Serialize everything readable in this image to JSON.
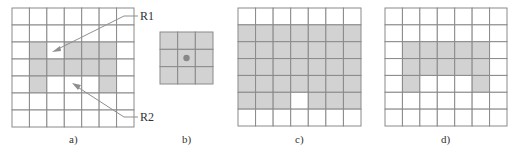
{
  "figure": {
    "colors": {
      "shaded": "#d2d2d2",
      "empty": "#ffffff",
      "grid_line": "#8a8a8a",
      "dot": "#888888"
    },
    "panels": [
      {
        "id": "a",
        "caption": "a)",
        "rows": 7,
        "cols": 7,
        "shaded": [
          [
            2,
            1
          ],
          [
            2,
            3
          ],
          [
            2,
            4
          ],
          [
            2,
            5
          ],
          [
            3,
            1
          ],
          [
            3,
            2
          ],
          [
            3,
            3
          ],
          [
            3,
            4
          ],
          [
            3,
            5
          ],
          [
            4,
            1
          ],
          [
            4,
            5
          ]
        ],
        "callouts": [
          {
            "label": "R1",
            "points_to_cell": [
              2,
              2
            ]
          },
          {
            "label": "R2",
            "points_to_cell": [
              4,
              3
            ]
          }
        ]
      },
      {
        "id": "b",
        "caption": "b)",
        "rows": 3,
        "cols": 3,
        "all_shaded": true,
        "center_dot_cell": [
          1,
          1
        ]
      },
      {
        "id": "c",
        "caption": "c)",
        "rows": 7,
        "cols": 7,
        "shaded": [
          [
            1,
            0
          ],
          [
            1,
            1
          ],
          [
            1,
            2
          ],
          [
            1,
            3
          ],
          [
            1,
            4
          ],
          [
            1,
            5
          ],
          [
            1,
            6
          ],
          [
            2,
            0
          ],
          [
            2,
            1
          ],
          [
            2,
            2
          ],
          [
            2,
            3
          ],
          [
            2,
            4
          ],
          [
            2,
            5
          ],
          [
            2,
            6
          ],
          [
            3,
            0
          ],
          [
            3,
            1
          ],
          [
            3,
            2
          ],
          [
            3,
            3
          ],
          [
            3,
            4
          ],
          [
            3,
            5
          ],
          [
            3,
            6
          ],
          [
            4,
            0
          ],
          [
            4,
            1
          ],
          [
            4,
            2
          ],
          [
            4,
            3
          ],
          [
            4,
            4
          ],
          [
            4,
            5
          ],
          [
            4,
            6
          ],
          [
            5,
            0
          ],
          [
            5,
            1
          ],
          [
            5,
            2
          ],
          [
            5,
            4
          ],
          [
            5,
            5
          ],
          [
            5,
            6
          ]
        ]
      },
      {
        "id": "d",
        "caption": "d)",
        "rows": 7,
        "cols": 7,
        "shaded": [
          [
            2,
            1
          ],
          [
            2,
            2
          ],
          [
            2,
            3
          ],
          [
            2,
            4
          ],
          [
            2,
            5
          ],
          [
            3,
            1
          ],
          [
            3,
            2
          ],
          [
            3,
            3
          ],
          [
            3,
            4
          ],
          [
            3,
            5
          ],
          [
            4,
            1
          ],
          [
            4,
            5
          ]
        ]
      }
    ]
  }
}
